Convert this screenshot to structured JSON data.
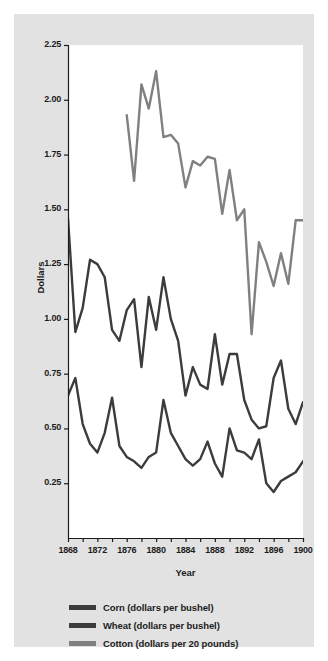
{
  "chart_data": {
    "type": "line",
    "title": "",
    "xlabel": "Year",
    "ylabel": "Dollars",
    "xlim": [
      1868,
      1900
    ],
    "ylim": [
      0.0,
      2.25
    ],
    "grid": false,
    "legend_position": "below-plot",
    "y_ticks": [
      0.25,
      0.5,
      0.75,
      1.0,
      1.25,
      1.5,
      1.75,
      2.0,
      2.25
    ],
    "y_tick_labels": [
      "0.25",
      "0.50",
      "0.75",
      "1.00",
      "1.25",
      "1.50",
      "1.75",
      "2.00",
      "2.25"
    ],
    "x_ticks": [
      1868,
      1870,
      1872,
      1874,
      1876,
      1878,
      1880,
      1882,
      1884,
      1886,
      1888,
      1890,
      1892,
      1894,
      1896,
      1898,
      1900
    ],
    "x_tick_labels": [
      "1868",
      "",
      "1872",
      "",
      "1876",
      "",
      "1880",
      "",
      "1884",
      "",
      "1888",
      "",
      "1892",
      "",
      "1896",
      "",
      "1900"
    ],
    "x_labeled_ticks": [
      1868,
      1872,
      1876,
      1880,
      1884,
      1888,
      1892,
      1896,
      1900
    ],
    "colors": {
      "corn": "#3c3c3c",
      "wheat": "#3c3c3c",
      "cotton": "#808080",
      "panel_background": "#ffffff",
      "figure_background": "#e2e2e2",
      "axis": "#1c1c1c",
      "text": "#1c1c1c"
    },
    "series": [
      {
        "name": "Corn (dollars per bushel)",
        "key": "corn",
        "color": "#3c3c3c",
        "x": [
          1868,
          1869,
          1870,
          1871,
          1872,
          1873,
          1874,
          1875,
          1876,
          1877,
          1878,
          1879,
          1880,
          1881,
          1882,
          1883,
          1884,
          1885,
          1886,
          1887,
          1888,
          1889,
          1890,
          1891,
          1892,
          1893,
          1894,
          1895,
          1896,
          1897,
          1898,
          1899,
          1900
        ],
        "values": [
          0.65,
          0.73,
          0.52,
          0.43,
          0.39,
          0.48,
          0.64,
          0.42,
          0.37,
          0.35,
          0.32,
          0.37,
          0.39,
          0.63,
          0.48,
          0.42,
          0.36,
          0.33,
          0.36,
          0.44,
          0.34,
          0.28,
          0.5,
          0.4,
          0.39,
          0.36,
          0.45,
          0.25,
          0.21,
          0.26,
          0.28,
          0.3,
          0.35
        ]
      },
      {
        "name": "Wheat (dollars per bushel)",
        "key": "wheat",
        "color": "#3c3c3c",
        "x": [
          1868,
          1869,
          1870,
          1871,
          1872,
          1873,
          1874,
          1875,
          1876,
          1877,
          1878,
          1879,
          1880,
          1881,
          1882,
          1883,
          1884,
          1885,
          1886,
          1887,
          1888,
          1889,
          1890,
          1891,
          1892,
          1893,
          1894,
          1895,
          1896,
          1897,
          1898,
          1899,
          1900
        ],
        "values": [
          1.46,
          0.94,
          1.05,
          1.27,
          1.25,
          1.19,
          0.95,
          0.9,
          1.04,
          1.09,
          0.78,
          1.1,
          0.95,
          1.19,
          1.0,
          0.9,
          0.65,
          0.78,
          0.7,
          0.68,
          0.93,
          0.7,
          0.84,
          0.84,
          0.63,
          0.54,
          0.5,
          0.51,
          0.73,
          0.81,
          0.59,
          0.52,
          0.62
        ]
      },
      {
        "name": "Cotton (dollars per 20 pounds)",
        "key": "cotton",
        "color": "#808080",
        "x": [
          1876,
          1877,
          1878,
          1879,
          1880,
          1881,
          1882,
          1883,
          1884,
          1885,
          1886,
          1887,
          1888,
          1889,
          1890,
          1891,
          1892,
          1893,
          1894,
          1895,
          1896,
          1897,
          1898,
          1899,
          1900
        ],
        "values": [
          1.93,
          1.63,
          2.07,
          1.96,
          2.13,
          1.83,
          1.84,
          1.8,
          1.6,
          1.72,
          1.7,
          1.74,
          1.73,
          1.48,
          1.68,
          1.45,
          1.5,
          0.93,
          1.35,
          1.26,
          1.15,
          1.3,
          1.16,
          1.45,
          1.45
        ]
      }
    ]
  },
  "axis_titles": {
    "x": "Year",
    "y": "Dollars"
  },
  "legend": {
    "items": [
      {
        "label": "Corn (dollars per bushel)",
        "color": "#3c3c3c"
      },
      {
        "label": "Wheat (dollars per bushel)",
        "color": "#3c3c3c"
      },
      {
        "label": "Cotton (dollars per 20 pounds)",
        "color": "#808080"
      }
    ]
  }
}
